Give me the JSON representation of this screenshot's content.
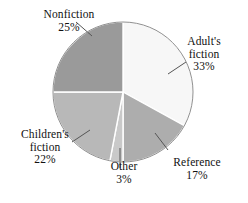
{
  "chart_data": {
    "type": "pie",
    "title": "",
    "categories": [
      "Adult's fiction",
      "Reference",
      "Other",
      "Children's fiction",
      "Nonfiction"
    ],
    "values": [
      33,
      17,
      3,
      22,
      25
    ],
    "value_suffix": "%",
    "start_angle_deg": 0,
    "direction": "clockwise",
    "legend": "none",
    "grid": false,
    "slices": [
      {
        "label": "Adult's fiction",
        "label_line1": "Adult's",
        "label_line2": "fiction",
        "value": 33,
        "pct_text": "33%",
        "color": "#f7f7f7"
      },
      {
        "label": "Reference",
        "label_line1": "Reference",
        "label_line2": "",
        "value": 17,
        "pct_text": "17%",
        "color": "#adadad"
      },
      {
        "label": "Other",
        "label_line1": "Other",
        "label_line2": "",
        "value": 3,
        "pct_text": "3%",
        "color": "#c9c9c9"
      },
      {
        "label": "Children's fiction",
        "label_line1": "Children's",
        "label_line2": "fiction",
        "value": 22,
        "pct_text": "22%",
        "color": "#b8b8b8"
      },
      {
        "label": "Nonfiction",
        "label_line1": "Nonfiction",
        "label_line2": "",
        "value": 25,
        "pct_text": "25%",
        "color": "#9a9a9a"
      }
    ]
  },
  "geometry": {
    "center_x": 123,
    "center_y": 92,
    "radius": 70,
    "outline_color": "#8f8f8f",
    "separator_color": "#ffffff",
    "leader_color": "#555555"
  }
}
